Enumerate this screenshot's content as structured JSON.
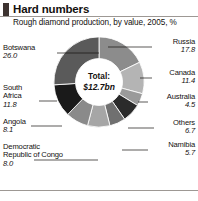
{
  "header": {
    "title": "Hard numbers",
    "subtitle": "Rough diamond production, by value, 2005, %",
    "brand_mark_color": "#3d3330",
    "rule_color": "#9d9894"
  },
  "center": {
    "total_label": "Total:",
    "total_value": "$12.7bn"
  },
  "chart_data": {
    "type": "pie",
    "title": "Hard numbers",
    "subtitle": "Rough diamond production, by value, 2005, %",
    "unit": "%",
    "total": "$12.7bn",
    "donut": true,
    "inner_radius_ratio": 0.52,
    "legend": "callout-labels",
    "categories": [
      "Russia",
      "Canada",
      "Australia",
      "Others",
      "Namibia",
      "Democratic Republic of Congo",
      "Angola",
      "South Africa",
      "Botswana"
    ],
    "values": [
      17.8,
      11.4,
      4.5,
      6.7,
      5.7,
      8.0,
      8.1,
      11.8,
      26.0
    ],
    "colors": [
      "#8c8c8c",
      "#b4b4b4",
      "#9a9a9a",
      "#2b2b2b",
      "#707070",
      "#a6a6a6",
      "#8a8a8a",
      "#1a1a1a",
      "#5a5a5a"
    ]
  },
  "labels": {
    "botswana": {
      "name": "Botswana",
      "value": "26.0"
    },
    "south_africa": {
      "name_line1": "South",
      "name_line2": "Africa",
      "value": "11.8"
    },
    "angola": {
      "name": "Angola",
      "value": "8.1"
    },
    "drc": {
      "name_line1": "Democratic",
      "name_line2": "Republic of Congo",
      "value": "8.0"
    },
    "russia": {
      "name": "Russia",
      "value": "17.8"
    },
    "canada": {
      "name": "Canada",
      "value": "11.4"
    },
    "australia": {
      "name": "Australia",
      "value": "4.5"
    },
    "others": {
      "name": "Others",
      "value": "6.7"
    },
    "namibia": {
      "name": "Namibia",
      "value": "5.7"
    }
  }
}
